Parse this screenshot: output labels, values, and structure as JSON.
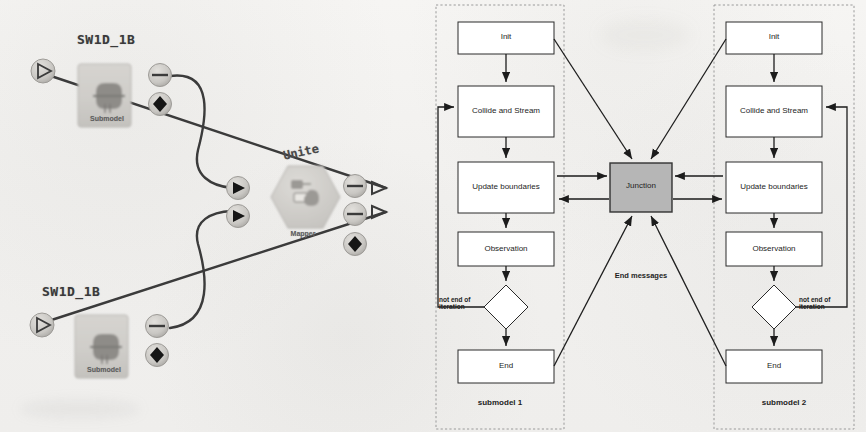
{
  "figure": {
    "background_color": "#f2f1ef",
    "panels": [
      {
        "id": "left",
        "kind": "model-canvas"
      },
      {
        "id": "right",
        "kind": "flowchart"
      }
    ]
  },
  "left_panel": {
    "name": "coupling-topology-canvas",
    "submodels": [
      {
        "id": "sw1d-top",
        "title": "SW1D_1B",
        "type_label": "Submodel"
      },
      {
        "id": "sw1d-bottom",
        "title": "SW1D_1B",
        "type_label": "Submodel"
      }
    ],
    "mapper": {
      "id": "mapper",
      "title": "Unite",
      "type_label": "Mapper"
    },
    "port_icons": [
      {
        "id": "in-port-top",
        "icon": "play-outline-icon"
      },
      {
        "id": "in-port-bottom",
        "icon": "play-outline-icon"
      },
      {
        "id": "out-port-top-dash",
        "icon": "dash-icon"
      },
      {
        "id": "out-port-top-diamond",
        "icon": "diamond-icon"
      },
      {
        "id": "out-port-bottom-dash",
        "icon": "dash-icon"
      },
      {
        "id": "out-port-bottom-diamond",
        "icon": "diamond-icon"
      },
      {
        "id": "mapper-in-top",
        "icon": "play-filled-icon"
      },
      {
        "id": "mapper-in-bottom",
        "icon": "play-filled-icon"
      },
      {
        "id": "mapper-out-top",
        "icon": "dash-icon"
      },
      {
        "id": "mapper-out-mid",
        "icon": "dash-icon"
      },
      {
        "id": "mapper-out-diamond",
        "icon": "diamond-icon"
      }
    ]
  },
  "right_panel": {
    "name": "submodel-execution-loop-flowchart",
    "junction": {
      "label": "Junction",
      "fill": "#b6b6b6",
      "stroke": "#333333"
    },
    "center_note": "End messages",
    "submodels": [
      {
        "id": "submodel-1",
        "container_label": "submodel 1",
        "loop_label": "not end of\niteration",
        "steps": [
          {
            "id": "init",
            "label": "Init"
          },
          {
            "id": "collide",
            "label": "Collide and Stream"
          },
          {
            "id": "boundary",
            "label": "Update boundaries"
          },
          {
            "id": "observe",
            "label": "Observation"
          },
          {
            "id": "decision",
            "label": "",
            "shape": "diamond"
          },
          {
            "id": "end",
            "label": "End"
          }
        ]
      },
      {
        "id": "submodel-2",
        "container_label": "submodel 2",
        "loop_label": "not end of\niteration",
        "steps": [
          {
            "id": "init",
            "label": "Init"
          },
          {
            "id": "collide",
            "label": "Collide and Stream"
          },
          {
            "id": "boundary",
            "label": "Update boundaries"
          },
          {
            "id": "observe",
            "label": "Observation"
          },
          {
            "id": "decision",
            "label": "",
            "shape": "diamond"
          },
          {
            "id": "end",
            "label": "End"
          }
        ]
      }
    ]
  }
}
